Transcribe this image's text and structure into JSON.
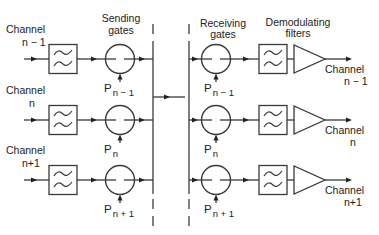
{
  "headers": {
    "sending_gates": [
      "Sending",
      "gates"
    ],
    "receiving_gates": [
      "Receiving",
      "gates"
    ],
    "demodulating_filters": [
      "Demodulating",
      "filters"
    ]
  },
  "rows": [
    {
      "y": 59,
      "input_label": [
        "Channel",
        "n − 1"
      ],
      "send_pulse": {
        "base": "P",
        "sub": "n − 1"
      },
      "recv_pulse": {
        "base": "P",
        "sub": "n − 1"
      },
      "output_label": [
        "Channel",
        "n − 1"
      ]
    },
    {
      "y": 120,
      "input_label": [
        "Channel",
        "n"
      ],
      "send_pulse": {
        "base": "P",
        "sub": "n"
      },
      "recv_pulse": {
        "base": "P",
        "sub": "n"
      },
      "output_label": [
        "Channel",
        "n"
      ]
    },
    {
      "y": 180,
      "input_label": [
        "Channel",
        "n+1"
      ],
      "send_pulse": {
        "base": "P",
        "sub": "n + 1"
      },
      "recv_pulse": {
        "base": "P",
        "sub": "n + 1"
      },
      "output_label": [
        "Channel",
        "n+1"
      ]
    }
  ],
  "link": {
    "y": 97
  },
  "colors": {
    "line": "#3a3a3a",
    "text": "#222222",
    "background": "#ffffff"
  }
}
